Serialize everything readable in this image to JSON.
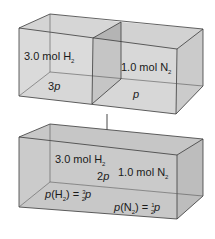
{
  "diagram": {
    "type": "gas-mixing-partial-pressure",
    "colors": {
      "box_light": "#dcdcdc",
      "box_mid": "#c9c9c9",
      "partition": "#b4b4b4",
      "edge": "#3a3a3a",
      "background": "#ffffff"
    },
    "before": {
      "left_compartment": {
        "amount": "3.0 mol H",
        "amount_sub": "2",
        "pressure": "3",
        "pressure_var": "p"
      },
      "right_compartment": {
        "amount": "1.0 mol N",
        "amount_sub": "2",
        "pressure_var": "p"
      }
    },
    "arrow": {
      "direction": "down"
    },
    "after": {
      "h2_amount": "3.0 mol H",
      "h2_sub": "2",
      "n2_amount": "1.0 mol N",
      "n2_sub": "2",
      "total_pressure": "2",
      "total_pressure_var": "p",
      "partial_h2": {
        "lhs_var": "p",
        "lhs_species": "(H",
        "lhs_sub": "2",
        "lhs_close": ") = ",
        "frac_num": "3",
        "frac_den": "2",
        "rhs_var": "p"
      },
      "partial_n2": {
        "lhs_var": "p",
        "lhs_species": "(N",
        "lhs_sub": "2",
        "lhs_close": ") = ",
        "frac_num": "1",
        "frac_den": "2",
        "rhs_var": "p"
      }
    }
  }
}
